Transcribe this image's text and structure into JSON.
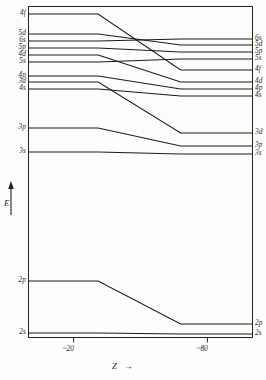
{
  "chart_data": {
    "type": "line",
    "title": "",
    "xlabel": "Z",
    "ylabel": "E",
    "xlabel_arrow": "→",
    "ylabel_arrow": "↑",
    "grid": false,
    "legend": "none",
    "axis_note": "Schematic atomic orbital energy levels versus atomic number Z; energies decrease downward is not marked numerically, only relative ordering is shown.",
    "xlim": [
      0,
      100
    ],
    "xticks": [
      20,
      80
    ],
    "xticklabels": [
      "~20",
      "~80"
    ],
    "yticks": [],
    "yticklabels": [],
    "series": [
      {
        "name": "4f",
        "left_label": "4f",
        "right_label": "4f",
        "x": [
          0,
          31,
          68,
          100
        ],
        "y": [
          14,
          14,
          70,
          70
        ]
      },
      {
        "name": "5d",
        "left_label": "5d",
        "right_label": "5d",
        "x": [
          0,
          31,
          68,
          100
        ],
        "y": [
          34,
          34,
          45,
          45
        ]
      },
      {
        "name": "6s",
        "left_label": "6s",
        "right_label": "6s",
        "x": [
          0,
          31,
          68,
          100
        ],
        "y": [
          41,
          41,
          39,
          39
        ]
      },
      {
        "name": "5p",
        "left_label": "5p",
        "right_label": "5p",
        "x": [
          0,
          31,
          68,
          100
        ],
        "y": [
          48,
          48,
          52,
          52
        ]
      },
      {
        "name": "4d",
        "left_label": "4d",
        "right_label": "4d",
        "x": [
          0,
          31,
          68,
          100
        ],
        "y": [
          55,
          55,
          82,
          82
        ]
      },
      {
        "name": "5s",
        "left_label": "5s",
        "right_label": "5s",
        "x": [
          0,
          31,
          68,
          100
        ],
        "y": [
          62,
          62,
          59,
          59
        ]
      },
      {
        "name": "4p",
        "left_label": "4p",
        "right_label": "4p",
        "x": [
          0,
          31,
          68,
          100
        ],
        "y": [
          76,
          76,
          89,
          89
        ]
      },
      {
        "name": "3d",
        "left_label": "3d",
        "right_label": "3d",
        "x": [
          0,
          31,
          68,
          100
        ],
        "y": [
          82,
          82,
          133,
          133
        ]
      },
      {
        "name": "4s",
        "left_label": "4s",
        "right_label": "4s",
        "x": [
          0,
          31,
          68,
          100
        ],
        "y": [
          89,
          89,
          96,
          96
        ]
      },
      {
        "name": "3p",
        "left_label": "3p",
        "right_label": "3p",
        "x": [
          0,
          31,
          68,
          100
        ],
        "y": [
          128,
          128,
          146,
          146
        ]
      },
      {
        "name": "3s",
        "left_label": "3s",
        "right_label": "3s",
        "x": [
          0,
          31,
          68,
          100
        ],
        "y": [
          152,
          152,
          154,
          154
        ]
      },
      {
        "name": "2p",
        "left_label": "2p",
        "right_label": "2p",
        "x": [
          0,
          31,
          68,
          100
        ],
        "y": [
          281,
          281,
          324,
          324
        ]
      },
      {
        "name": "2s",
        "left_label": "2s",
        "right_label": "2s",
        "x": [
          0,
          31,
          68,
          100
        ],
        "y": [
          333,
          333,
          334,
          334
        ]
      }
    ]
  },
  "frame": {
    "stroke": "#222222"
  },
  "style": {
    "line_color": "#1a1a1a",
    "frame_color": "#222222",
    "text_color": "#1f1f1f"
  }
}
